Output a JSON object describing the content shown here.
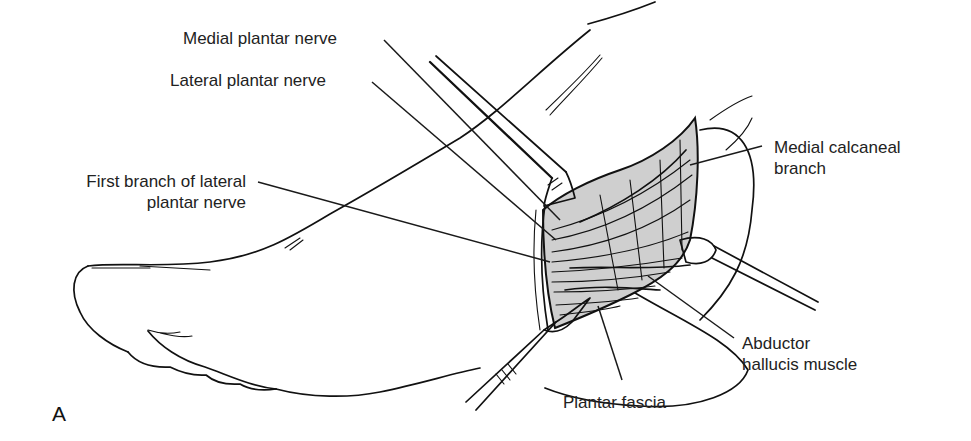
{
  "figure": {
    "panel_letter": "A",
    "colors": {
      "ink": "#111111",
      "label_text": "#222222",
      "exposure_fill": "#cfcfcf",
      "background": "#ffffff"
    }
  },
  "labels": {
    "medial_plantar_nerve": "Medial plantar nerve",
    "lateral_plantar_nerve": "Lateral plantar nerve",
    "first_branch_line1": "First branch of lateral",
    "first_branch_line2": "plantar nerve",
    "medial_calcaneal_line1": "Medial calcaneal",
    "medial_calcaneal_line2": "branch",
    "abductor_line1": "Abductor",
    "abductor_line2": "hallucis muscle",
    "plantar_fascia": "Plantar fascia"
  },
  "instruments": [
    {
      "name": "upper-retractor"
    },
    {
      "name": "right-retractor"
    },
    {
      "name": "scalpel"
    }
  ]
}
